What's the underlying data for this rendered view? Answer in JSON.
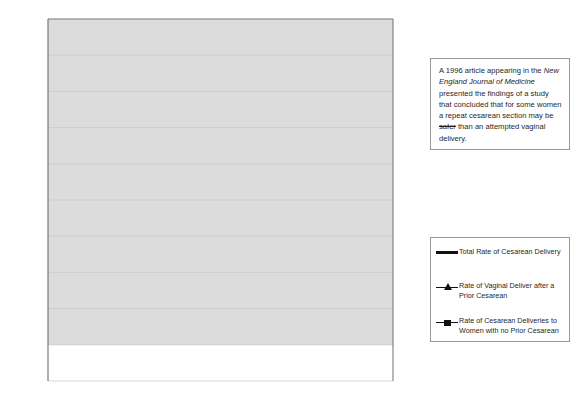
{
  "chart_data": {
    "type": "line",
    "title": "",
    "xlabel": "",
    "ylabel": "",
    "grid": true,
    "legend_position": "right-outside",
    "ylim": [
      10,
      30
    ],
    "ytick_step": 2,
    "ytick_labels": [
      "30%",
      "28%",
      "26%",
      "24%",
      "22%",
      "20%",
      "18%",
      "16%",
      "14%",
      "12%",
      "10%"
    ],
    "categories": [
      "1989",
      "1990",
      "1991",
      "1992",
      "1993",
      "1994",
      "1995",
      "1996",
      "1997",
      "1998",
      "1999",
      "2000",
      "2001"
    ],
    "series": [
      {
        "name": "Total Rate of Cesarean Delivery",
        "marker": "none",
        "style": "thick-smooth",
        "values": [
          22.8,
          22.8,
          22.7,
          22.4,
          22.0,
          21.6,
          21.2,
          20.8,
          20.7,
          20.8,
          21.2,
          22.0,
          24.4
        ]
      },
      {
        "name": "Rate of Vaginal Deliver after a Prior Cesarean",
        "marker": "triangle",
        "style": "thin",
        "values": [
          18.9,
          19.9,
          21.3,
          22.4,
          24.2,
          26.2,
          27.4,
          28.3,
          27.3,
          26.1,
          23.4,
          20.6,
          16.8
        ]
      },
      {
        "name": "Rate of Cesarean Deliveries to Women with no Prior Cesarean",
        "marker": "square",
        "style": "thin",
        "values": [
          16.1,
          16.0,
          15.9,
          15.5,
          15.1,
          14.8,
          14.6,
          14.5,
          14.5,
          14.8,
          15.4,
          16.0,
          16.8
        ]
      }
    ],
    "annotations": [
      {
        "name": "total-rate-value-label",
        "text": "24.40%",
        "x": 0.905,
        "y": 24.55
      },
      {
        "name": "total-rate-change-label",
        "text": "+18%",
        "x": 1.02,
        "y": 24.3
      },
      {
        "name": "no-prior-cesarean-change-label",
        "text": "+16%",
        "x": 1.02,
        "y": 17.7
      },
      {
        "name": "vbac-change-label",
        "text": "-42%",
        "x": 1.02,
        "y": 15.3
      }
    ],
    "change_header": {
      "line1": "% Change",
      "line2": "1996 to 2001",
      "arrow": "down-arrow-icon"
    }
  },
  "note": {
    "segments": [
      {
        "text": "A 1996 article appearing in the ",
        "style": "normal"
      },
      {
        "text": "New England Journal of Medicine",
        "style": "italic"
      },
      {
        "text": " presented the findings of a study that concluded that for some women a repeat cesarean section may be ",
        "style": "normal"
      },
      {
        "text": "safer",
        "style": "strikethrough"
      },
      {
        "text": " than an attempted vaginal delivery.",
        "style": "normal"
      }
    ],
    "plain": "A 1996 article appearing in the New England Journal of Medicine presented the findings of a study that concluded that for some women a repeat cesarean section may be safer than an attempted vaginal delivery."
  },
  "legend": {
    "items": [
      {
        "key": "thick-line",
        "label": "Total Rate of Cesarean Delivery"
      },
      {
        "key": "triangle-line",
        "label": "Rate of Vaginal Deliver after a Prior Cesarean"
      },
      {
        "key": "square-line",
        "label": "Rate of Cesarean Deliveries to Women with no Prior Cesarean"
      }
    ]
  },
  "colors": {
    "plot_background": "#dcdcdc",
    "line": "#111111",
    "gridline": "#c9c9c9",
    "axis": "#6e6e6e",
    "text": "#1f1f1f",
    "box_border": "#9a9a9a"
  }
}
